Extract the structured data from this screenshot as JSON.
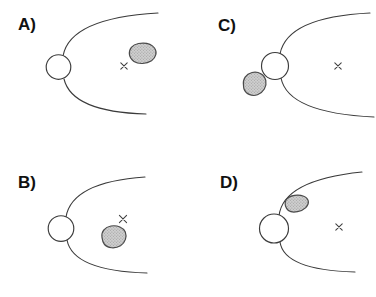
{
  "figure": {
    "width": 376,
    "height": 297,
    "background": "#ffffff",
    "stroke_color": "#3b3b3b",
    "label_color": "#111111",
    "cross_color": "#3f3f3f",
    "blob": {
      "fill": "#cfcfcf",
      "dot": "#8c8c8c",
      "dot2": "#9a9a9a",
      "outline": "#4a4a4a"
    },
    "panels": [
      {
        "id": "A",
        "label": "A)",
        "label_pos": {
          "x": 18,
          "y": 30
        },
        "circle": {
          "cx": 58.5,
          "cy": 67,
          "r": 12.3
        },
        "upper_curve": "M 63,56 Q 70,18 158,13",
        "lower_curve": "M 64,79 Q 72,112 146,114",
        "cross": {
          "x": 124,
          "y": 66,
          "size": 3.2
        },
        "blob_path": "M 129.5,55 C 128.5,49 132.5,44.5 138.5,43.5 C 145,42.5 151.5,44 154.5,48 C 157.5,52 156,57.5 151.5,60.8 C 146.5,64 138.5,64.5 134,61.5 C 131,59.5 130,57.5 129.5,55 Z"
      },
      {
        "id": "B",
        "label": "B)",
        "label_pos": {
          "x": 18,
          "y": 188
        },
        "circle": {
          "cx": 61,
          "cy": 228.5,
          "r": 12.8
        },
        "upper_curve": "M 66,217 Q 72,182 145,177",
        "lower_curve": "M 67,240 Q 73,271 147,273",
        "cross": {
          "x": 123,
          "y": 219,
          "size": 3.6
        },
        "blob_path": "M 102,237.5 C 101,231.5 105,227 111,226 C 117.5,225 123.5,227.5 125.3,232 C 127,236.5 125.5,242.5 120.5,245.8 C 115,249 107.5,248.2 104.5,244.5 C 102.5,242 102.3,240 102,237.5 Z"
      },
      {
        "id": "C",
        "label": "C)",
        "label_pos": {
          "x": 218,
          "y": 31
        },
        "circle": {
          "cx": 275,
          "cy": 66,
          "r": 13.5
        },
        "upper_curve": "M 280,54 Q 287,17 370,13",
        "lower_curve": "M 281,78 Q 288,113 374,117",
        "cross": {
          "x": 338,
          "y": 66,
          "size": 3.2
        },
        "blob_path": "M 243.5,85.5 C 242.5,79 246,74 252,72.5 C 258.5,71 264.5,74.5 265.8,80.5 C 267,86.5 263.5,92.5 257.5,94.8 C 251.5,97 245.5,93.5 244,89 C 243.6,87.8 243.6,86.7 243.5,85.5 Z"
      },
      {
        "id": "D",
        "label": "D)",
        "label_pos": {
          "x": 220,
          "y": 188
        },
        "circle": {
          "cx": 274,
          "cy": 228.5,
          "r": 14.5
        },
        "upper_curve": "M 279,216 Q 283,180 362,172",
        "lower_curve": "M 280,242 Q 284,270 355,272",
        "cross": {
          "x": 339,
          "y": 227,
          "size": 3.2
        },
        "blob_path": "M 285.5,206 C 284,200.5 287.5,196.3 294.5,195.3 C 301.5,194.3 307.5,196.8 308.3,201.2 C 309.1,205.7 304.5,210.2 297.5,211.7 C 291,213 287,211 285.5,206 Z"
      }
    ]
  }
}
